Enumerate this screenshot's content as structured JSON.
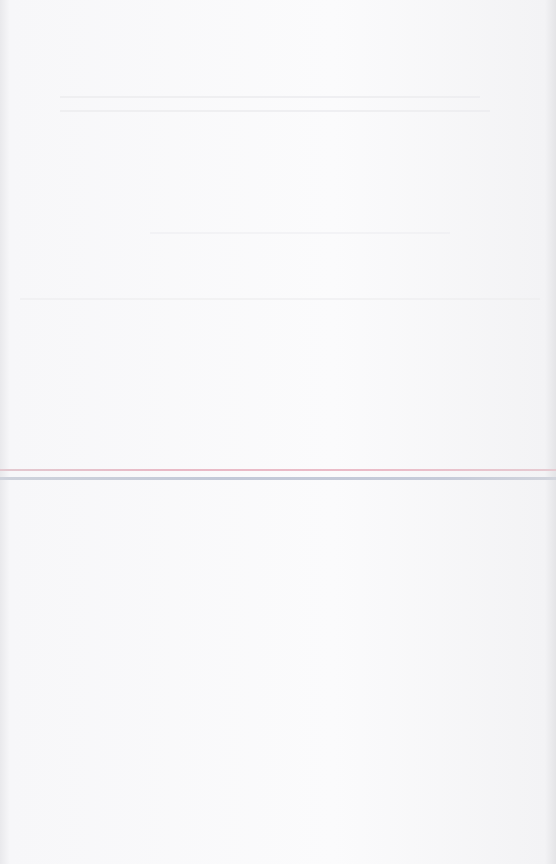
{
  "document": {
    "type": "blank scanned page",
    "colors": {
      "paper": "#fbfbfc",
      "rule_top": "#e9b9c6",
      "rule_bottom": "#c3c9d8"
    }
  }
}
